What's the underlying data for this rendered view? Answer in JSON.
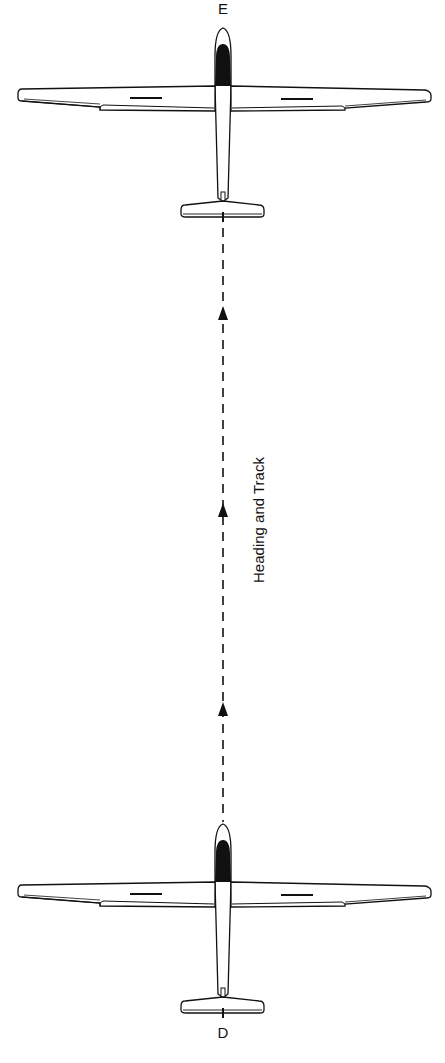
{
  "diagram": {
    "labels": {
      "top_point": "E",
      "bottom_point": "D",
      "path_label": "Heading and Track"
    },
    "elements": [
      {
        "id": "glider-top",
        "type": "glider-plan-view",
        "position": "top",
        "heading": "north"
      },
      {
        "id": "glider-bottom",
        "type": "glider-plan-view",
        "position": "bottom",
        "heading": "north"
      },
      {
        "id": "track-line",
        "type": "dashed-line",
        "direction": "up",
        "arrows": 3
      }
    ],
    "colors": {
      "line": "#111111",
      "canopy": "#111111",
      "background": "#ffffff"
    }
  },
  "caption_clipped": ""
}
